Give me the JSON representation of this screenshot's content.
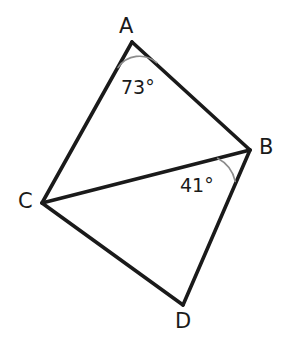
{
  "figure": {
    "kind": "geometry-quadrilateral-with-diagonal",
    "background_color": "#ffffff",
    "stroke_color": "#1a1a1a",
    "arc_color": "#8c8c8c",
    "stroke_width": 3.6,
    "arc_width": 1.5
  },
  "vertices": [
    {
      "id": "A",
      "label": "A",
      "x": 132,
      "y": 42,
      "label_x": 119,
      "label_y": 16
    },
    {
      "id": "B",
      "label": "B",
      "x": 250,
      "y": 150,
      "label_x": 259,
      "label_y": 137
    },
    {
      "id": "C",
      "label": "C",
      "x": 42,
      "y": 203,
      "label_x": 18,
      "label_y": 191
    },
    {
      "id": "D",
      "label": "D",
      "x": 183,
      "y": 305,
      "label_x": 175,
      "label_y": 311
    }
  ],
  "edges": [
    {
      "id": "AB",
      "from": "A",
      "to": "B",
      "x1": 132,
      "y1": 42,
      "x2": 250,
      "y2": 150
    },
    {
      "id": "AC",
      "from": "A",
      "to": "C",
      "x1": 132,
      "y1": 42,
      "x2": 42,
      "y2": 203
    },
    {
      "id": "CD",
      "from": "C",
      "to": "D",
      "x1": 42,
      "y1": 203,
      "x2": 183,
      "y2": 305
    },
    {
      "id": "BD",
      "from": "B",
      "to": "D",
      "x1": 250,
      "y1": 150,
      "x2": 183,
      "y2": 305
    },
    {
      "id": "CB",
      "from": "C",
      "to": "B",
      "x1": 42,
      "y1": 203,
      "x2": 250,
      "y2": 150
    }
  ],
  "angles": [
    {
      "id": "angle-A",
      "at_vertex": "A",
      "label": "73°",
      "value": 73,
      "unit": "degrees",
      "label_x": 121,
      "label_y": 78,
      "arc_path": "M 118.0 67.6 A 26 26 0 0 1 156.7 62.7"
    },
    {
      "id": "angle-B",
      "at_vertex": "B",
      "label": "41°",
      "value": 41,
      "unit": "degrees",
      "label_x": 180,
      "label_y": 176,
      "arc_path": "M 217.6 158.3 A 34 34 0 0 1 235.2 181.4"
    }
  ]
}
